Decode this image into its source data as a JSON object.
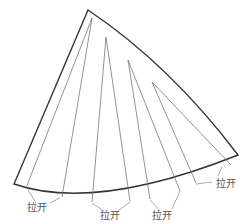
{
  "diagram": {
    "type": "pattern-slash-and-spread",
    "labels": [
      {
        "text": "拉开",
        "x": 27,
        "y": 211
      },
      {
        "text": "拉开",
        "x": 100,
        "y": 219
      },
      {
        "text": "拉开",
        "x": 152,
        "y": 219
      },
      {
        "text": "拉开",
        "x": 216,
        "y": 187
      }
    ],
    "colors": {
      "outline": "#333333",
      "slash": "#777777",
      "text": "#555555"
    }
  }
}
